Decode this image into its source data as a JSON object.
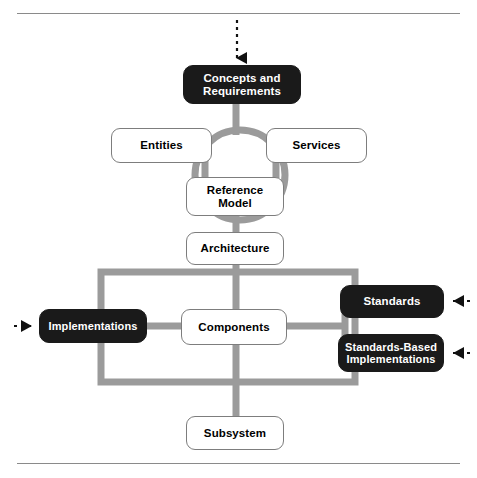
{
  "figure": {
    "colors": {
      "connector_gray": "#9b9b9b",
      "node_black": "#1a1a1a",
      "node_white": "#ffffff",
      "node_border": "#7d7d7d",
      "rule_gray": "#8a8a8a",
      "arrow_black": "#111111"
    },
    "rules": {
      "top_y": 13,
      "bottom_y": 463
    }
  },
  "nodes": {
    "concepts_and_requirements": {
      "label": "Concepts and\nRequirements",
      "line1": "Concepts and",
      "line2": "Requirements",
      "style": "black",
      "x": 183,
      "y": 65,
      "w": 118,
      "h": 39,
      "font": 11.5
    },
    "entities": {
      "label": "Entities",
      "style": "white",
      "x": 111,
      "y": 128,
      "w": 101,
      "h": 35,
      "font": 11.5
    },
    "services": {
      "label": "Services",
      "style": "white",
      "x": 266,
      "y": 128,
      "w": 101,
      "h": 35,
      "font": 11.5
    },
    "reference_model": {
      "label": "Reference\nModel",
      "line1": "Reference",
      "line2": "Model",
      "style": "white",
      "x": 186,
      "y": 177,
      "w": 98,
      "h": 39,
      "font": 11.5
    },
    "architecture": {
      "label": "Architecture",
      "style": "white",
      "x": 186,
      "y": 232,
      "w": 98,
      "h": 33,
      "font": 11.5
    },
    "components": {
      "label": "Components",
      "style": "white",
      "x": 181,
      "y": 309,
      "w": 106,
      "h": 36,
      "font": 11.5
    },
    "implementations": {
      "label": "Implementations",
      "style": "black",
      "x": 39,
      "y": 309,
      "w": 108,
      "h": 34,
      "font": 11
    },
    "standards": {
      "label": "Standards",
      "style": "black",
      "x": 340,
      "y": 285,
      "w": 104,
      "h": 33,
      "font": 11.5
    },
    "standards_based_implementations": {
      "label": "Standards-Based\nImplementations",
      "line1": "Standards-Based",
      "line2": "Implementations",
      "style": "black",
      "x": 338,
      "y": 334,
      "w": 106,
      "h": 38,
      "font": 11
    },
    "subsystem": {
      "label": "Subsystem",
      "style": "white",
      "x": 186,
      "y": 416,
      "w": 98,
      "h": 34,
      "font": 11.5
    }
  },
  "connectors": {
    "ring": {
      "cx": 240,
      "cy": 175,
      "r": 45,
      "stroke_width": 7
    },
    "rectangle": {
      "x": 101,
      "y": 272,
      "w": 254,
      "h": 110,
      "stroke_width": 7
    },
    "vertical_spine_x": 236,
    "horizontal_bus_y": 326
  },
  "arrows": {
    "top_inbound": {
      "name": "dashed-arrow-down",
      "direction": "down",
      "x": 237,
      "y_start": 20,
      "y_end": 62
    },
    "left_inbound": {
      "name": "dashed-arrow-right",
      "direction": "right",
      "y": 326,
      "x_start": 14,
      "x_end": 38
    },
    "standards_inbound": {
      "name": "dashed-arrow-left",
      "direction": "left",
      "y": 301,
      "x_start": 470,
      "x_end": 445
    },
    "standards_based_inbound": {
      "name": "dashed-arrow-left",
      "direction": "left",
      "y": 353,
      "x_start": 470,
      "x_end": 445
    }
  }
}
